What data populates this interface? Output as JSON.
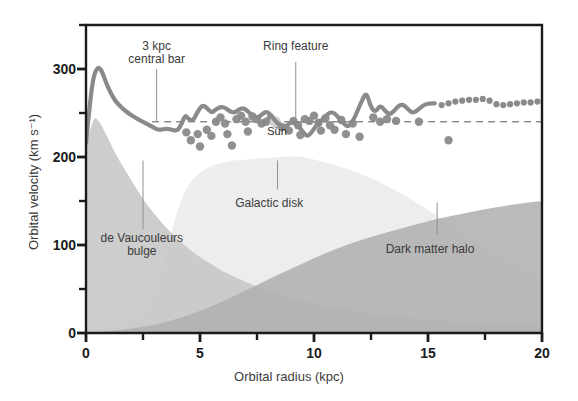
{
  "chart_data": {
    "type": "line",
    "title": "",
    "xlabel": "Orbital radius (kpc)",
    "ylabel": "Orbital velocity (km s⁻¹)",
    "xlim": [
      0,
      20
    ],
    "ylim": [
      0,
      350
    ],
    "grid": false,
    "legend": "none",
    "xticks": [
      0,
      5,
      10,
      15,
      20
    ],
    "xtick_labels": [
      "0",
      "5",
      "10",
      "15",
      "20"
    ],
    "xminor": [
      2.5,
      7.5,
      12.5,
      17.5
    ],
    "yticks": [
      0,
      100,
      200,
      300
    ],
    "ytick_labels": [
      "0",
      "100",
      "200",
      "300"
    ],
    "yminor": [
      50,
      150,
      250,
      350
    ],
    "reference_line": {
      "name": "flat rotation reference",
      "value": 240,
      "style": "dashed",
      "x_start": 2.9,
      "x_end": 20,
      "color": "#555555"
    },
    "series": [
      {
        "name": "Observed rotation curve",
        "style": "solid-line",
        "color": "#8a8a8a",
        "x": [
          0.0,
          0.15,
          0.3,
          0.45,
          0.6,
          0.75,
          0.9,
          1.1,
          1.3,
          1.6,
          1.9,
          2.2,
          2.5,
          2.8,
          3.0,
          3.15,
          3.3,
          3.45,
          3.6,
          3.75,
          3.9,
          4.05,
          4.2,
          4.35,
          4.5,
          4.7,
          4.9,
          5.1,
          5.3,
          5.5,
          5.7,
          5.9,
          6.1,
          6.3,
          6.5,
          6.7,
          6.9,
          7.1,
          7.3,
          7.5,
          7.7,
          7.9,
          8.1,
          8.3,
          8.5,
          8.7,
          8.9,
          9.1,
          9.3,
          9.5,
          9.7,
          9.9,
          10.1,
          10.3,
          10.5,
          10.7,
          10.9,
          11.1,
          11.3,
          11.5,
          11.7,
          11.9,
          12.1,
          12.3,
          12.5,
          12.7,
          12.9,
          13.1,
          13.3,
          13.5,
          13.7,
          13.9,
          14.1,
          14.3,
          14.5,
          14.7,
          14.9,
          15.1,
          15.3
        ],
        "y": [
          216,
          255,
          288,
          300,
          302,
          294,
          283,
          272,
          263,
          255,
          249,
          244,
          240,
          236,
          233,
          231,
          231,
          232,
          232,
          231,
          230,
          231,
          238,
          248,
          243,
          241,
          252,
          259,
          256,
          250,
          254,
          257,
          256,
          252,
          250,
          254,
          256,
          252,
          247,
          244,
          248,
          252,
          248,
          241,
          236,
          233,
          238,
          241,
          236,
          229,
          223,
          228,
          236,
          241,
          246,
          251,
          250,
          244,
          238,
          234,
          240,
          252,
          264,
          274,
          256,
          251,
          259,
          253,
          248,
          252,
          258,
          260,
          255,
          250,
          252,
          257,
          260,
          261,
          261
        ]
      },
      {
        "name": "Extrapolated rotation curve",
        "style": "dotted-line",
        "color": "#8a8a8a",
        "x": [
          15.6,
          15.9,
          16.2,
          16.5,
          16.8,
          17.1,
          17.4,
          17.7,
          18.0,
          18.3,
          18.6,
          18.9,
          19.2,
          19.5,
          19.8
        ],
        "y": [
          259,
          261,
          263,
          264,
          265,
          265,
          266,
          264,
          260,
          259,
          260,
          261,
          262,
          262,
          263
        ]
      },
      {
        "name": "Measured data points",
        "style": "scatter",
        "color": "#8a8a8a",
        "points": [
          [
            4.4,
            228
          ],
          [
            4.6,
            219
          ],
          [
            4.9,
            226
          ],
          [
            5.0,
            212
          ],
          [
            5.3,
            231
          ],
          [
            5.5,
            224
          ],
          [
            5.7,
            240
          ],
          [
            5.9,
            245
          ],
          [
            6.1,
            238
          ],
          [
            6.2,
            226
          ],
          [
            6.4,
            213
          ],
          [
            6.6,
            243
          ],
          [
            6.8,
            247
          ],
          [
            7.0,
            240
          ],
          [
            7.1,
            229
          ],
          [
            7.3,
            246
          ],
          [
            7.5,
            243
          ],
          [
            7.7,
            238
          ],
          [
            7.9,
            240
          ],
          [
            8.1,
            244
          ],
          [
            8.4,
            237
          ],
          [
            8.6,
            234
          ],
          [
            8.9,
            230
          ],
          [
            9.1,
            241
          ],
          [
            9.3,
            236
          ],
          [
            9.4,
            225
          ],
          [
            9.6,
            243
          ],
          [
            9.8,
            241
          ],
          [
            10.0,
            247
          ],
          [
            10.2,
            239
          ],
          [
            10.3,
            230
          ],
          [
            10.5,
            244
          ],
          [
            10.7,
            236
          ],
          [
            10.9,
            231
          ],
          [
            11.2,
            242
          ],
          [
            11.4,
            226
          ],
          [
            11.7,
            238
          ],
          [
            12.0,
            223
          ],
          [
            12.6,
            245
          ],
          [
            12.9,
            240
          ],
          [
            13.2,
            243
          ],
          [
            13.6,
            241
          ],
          [
            14.6,
            240
          ],
          [
            15.9,
            219
          ]
        ]
      }
    ],
    "sun_marker": {
      "label": "Sun",
      "x": 8.3,
      "y": 240,
      "color": "#d0d0d0"
    },
    "areas": [
      {
        "name": "de Vaucouleurs bulge",
        "color": "#c6c6c6",
        "x": [
          0,
          0.3,
          0.6,
          0.9,
          1.2,
          1.6,
          2.0,
          2.5,
          3.0,
          3.5,
          4.0,
          4.5,
          5.0,
          5.5,
          6.0,
          6.5,
          7.0,
          7.5,
          8.0,
          9.0,
          10.0,
          11.0,
          12.0,
          13.0,
          14.0,
          15.0,
          16.0,
          17.0,
          18.0,
          19.0,
          20.0
        ],
        "y": [
          210,
          248,
          240,
          225,
          208,
          190,
          173,
          152,
          135,
          120,
          107,
          96,
          86,
          78,
          70,
          64,
          58,
          53,
          48,
          40,
          33,
          28,
          24,
          20,
          17,
          15,
          13,
          11,
          10,
          9,
          8
        ]
      },
      {
        "name": "Galactic disk",
        "color": "#eaeaea",
        "x": [
          0,
          1,
          2,
          3,
          3.5,
          4,
          4.5,
          5,
          5.5,
          6,
          6.5,
          7,
          7.5,
          8,
          8.5,
          9,
          9.5,
          10,
          10.5,
          11,
          11.5,
          12,
          12.5,
          13,
          13.5,
          14,
          14.5,
          15,
          15.5,
          16,
          17,
          18,
          19,
          20
        ],
        "y": [
          0,
          6,
          14,
          40,
          88,
          140,
          170,
          183,
          190,
          194,
          196,
          197,
          198,
          199,
          200,
          201,
          200,
          197,
          194,
          190,
          186,
          181,
          176,
          170,
          163,
          156,
          148,
          140,
          131,
          122,
          104,
          87,
          72,
          58
        ]
      },
      {
        "name": "Dark matter halo",
        "color": "#b0b0b0",
        "x": [
          0,
          1,
          2,
          3,
          4,
          5,
          6,
          7,
          8,
          9,
          10,
          11,
          12,
          13,
          14,
          15,
          16,
          17,
          18,
          19,
          20
        ],
        "y": [
          0,
          2,
          5,
          9,
          16,
          25,
          36,
          48,
          61,
          73,
          85,
          96,
          105,
          113,
          120,
          127,
          133,
          138,
          143,
          147,
          150
        ]
      }
    ],
    "annotations": [
      {
        "name": "3 kpc central bar",
        "lines": [
          "3 kpc",
          "central bar"
        ],
        "x": 3.1,
        "leader_top": 300,
        "leader_bottom": 240
      },
      {
        "name": "Ring feature",
        "lines": [
          "Ring feature"
        ],
        "x": 9.2,
        "leader_top": 308,
        "leader_bottom": 240
      },
      {
        "name": "de Vaucouleurs bulge",
        "lines": [
          "de Vaucouleurs",
          "bulge"
        ],
        "x": 2.5,
        "leader_top": 196,
        "leader_bottom": 118
      },
      {
        "name": "Galactic disk",
        "lines": [
          "Galactic disk"
        ],
        "x": 8.4,
        "leader_top": 196,
        "leader_bottom": 163
      },
      {
        "name": "Dark matter halo",
        "lines": [
          "Dark matter halo"
        ],
        "x": 15.4,
        "leader_top": 148,
        "leader_bottom": 112
      }
    ]
  },
  "figure": {
    "axis_color": "#1b1b1b",
    "text_color": "#3b3b3b",
    "background": "#ffffff"
  }
}
